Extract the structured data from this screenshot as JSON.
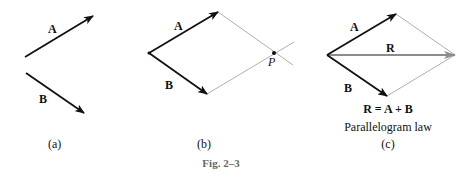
{
  "panels": {
    "a": {
      "caption": "(a)",
      "vector_a_label": "A",
      "vector_b_label": "B"
    },
    "b": {
      "caption": "(b)",
      "vector_a_label": "A",
      "vector_b_label": "B",
      "point_label": "P"
    },
    "c": {
      "caption": "(c)",
      "vector_a_label": "A",
      "vector_b_label": "B",
      "resultant_label": "R",
      "equation": "R = A + B",
      "title": "Parallelogram law"
    }
  },
  "figure_caption": "Fig. 2–3",
  "colors": {
    "vector": "#111111",
    "construction_line": "#9a9a9a",
    "resultant": "#8c8c8c",
    "caption_gray": "#666666"
  }
}
